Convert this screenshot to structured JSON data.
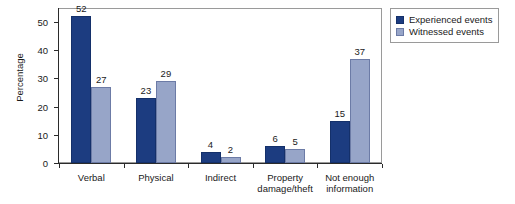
{
  "chart_data": {
    "type": "bar",
    "title": "",
    "xlabel": "",
    "ylabel": "Percentage",
    "ylim": [
      0,
      55
    ],
    "yticks": [
      0,
      10,
      20,
      30,
      40,
      50
    ],
    "grid": false,
    "legend_position": "right-outside",
    "categories": [
      "Verbal",
      "Physical",
      "Indirect",
      "Property\ndamage/theft",
      "Not enough\ninformation"
    ],
    "series": [
      {
        "name": "Experienced events",
        "color": "#1c3c80",
        "values": [
          52,
          23,
          4,
          6,
          15
        ]
      },
      {
        "name": "Witnessed events",
        "color": "#97a5c8",
        "values": [
          27,
          29,
          2,
          5,
          37
        ]
      }
    ]
  },
  "legend": {
    "items": [
      {
        "label": "Experienced events",
        "swatch": "exp"
      },
      {
        "label": "Witnessed events",
        "swatch": "wit"
      }
    ]
  },
  "axis": {
    "y_title": "Percentage",
    "y_tick_labels": [
      "0",
      "10",
      "20",
      "30",
      "40",
      "50"
    ]
  }
}
